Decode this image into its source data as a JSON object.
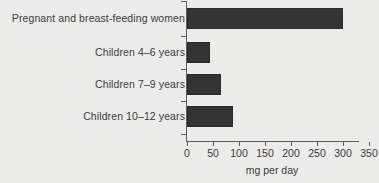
{
  "chart_data": {
    "type": "bar",
    "orientation": "horizontal",
    "title": "",
    "xlabel": "mg per day",
    "ylabel": "",
    "categories": [
      "Pregnant and breast-feeding women",
      "Children 4–6 years",
      "Children 7–9 years",
      "Children 10–12 years"
    ],
    "values": [
      300,
      45,
      65,
      88
    ],
    "xlim": [
      0,
      350
    ],
    "xticks": [
      0,
      50,
      100,
      150,
      200,
      250,
      300,
      350
    ],
    "xtick_labels": [
      "0",
      "50",
      "100",
      "150",
      "200",
      "250",
      "300",
      "350"
    ],
    "grid": false,
    "legend": null,
    "bar_color": "#343434",
    "background_color": "#ececeb",
    "axis_color": "#5d5d5d"
  }
}
